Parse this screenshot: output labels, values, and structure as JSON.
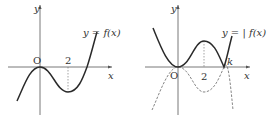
{
  "figure_left": {
    "y_axis_label": "y",
    "x_axis_label": "x",
    "origin_label": "O",
    "tick_label": "2",
    "curve_label": "y = f(x)"
  },
  "figure_right": {
    "y_axis_label": "y",
    "x_axis_label": "x",
    "origin_label": "O",
    "tick_label": "2",
    "root_label": "k",
    "curve_label": "y = | f(x) |"
  },
  "colors": {
    "curve": "#2a2a2a",
    "axis": "#555555",
    "dashed": "#666666"
  }
}
